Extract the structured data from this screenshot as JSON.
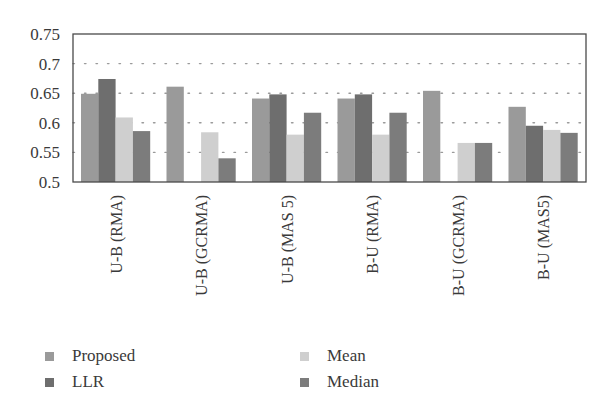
{
  "chart_data": {
    "type": "bar",
    "title": "",
    "xlabel": "",
    "ylabel": "",
    "ylim": [
      0.5,
      0.75
    ],
    "yticks": [
      0.5,
      0.55,
      0.6,
      0.65,
      0.7,
      0.75
    ],
    "ytick_labels": [
      "0.5",
      "0.55",
      "0.6",
      "0.65",
      "0.7",
      "0.75"
    ],
    "grid": {
      "y": true,
      "style": "dotted",
      "lines_at": [
        0.55,
        0.6,
        0.65,
        0.7
      ]
    },
    "categories": [
      "U-B (RMA)",
      "U-B (GCRMA)",
      "U-B (MAS 5)",
      "B-U (RMA)",
      "B-U (GCRMA)",
      "B-U (MAS5)"
    ],
    "series": [
      {
        "name": "Proposed",
        "color": "#9a9a9a",
        "values": [
          0.649,
          0.661,
          0.641,
          0.641,
          0.654,
          0.627
        ]
      },
      {
        "name": "LLR",
        "color": "#6e6e6e",
        "values": [
          0.674,
          null,
          0.648,
          0.648,
          null,
          0.595
        ]
      },
      {
        "name": "Mean",
        "color": "#cfcfcf",
        "values": [
          0.609,
          0.584,
          0.58,
          0.58,
          0.566,
          0.588
        ]
      },
      {
        "name": "Median",
        "color": "#7c7c7c",
        "values": [
          0.586,
          0.54,
          0.617,
          0.617,
          0.566,
          0.583
        ]
      }
    ],
    "legend": {
      "position": "bottom",
      "columns": 2,
      "entries": [
        "Proposed",
        "LLR",
        "Mean",
        "Median"
      ]
    }
  }
}
